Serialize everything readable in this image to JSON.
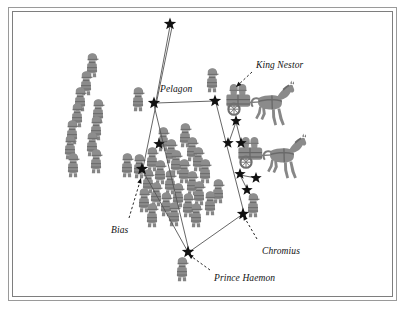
{
  "diagram": {
    "background_color": "#ffffff",
    "frame": {
      "outer_color": "#9a9a9a",
      "inner_color": "#7e7e7e"
    },
    "colors": {
      "figure_fill": "#8d8d8d",
      "figure_dark": "#6f6f6f",
      "star": "#111111",
      "line": "#555555",
      "text": "#111111"
    },
    "labels": [
      {
        "id": "king-nestor",
        "text": "King Nestor",
        "x": 256,
        "y": 60,
        "anchor_x": 236,
        "anchor_y": 87,
        "arrow_from_x": 252,
        "arrow_from_y": 72
      },
      {
        "id": "pelagon",
        "text": "Pelagon",
        "x": 160,
        "y": 84,
        "anchor_x": 0,
        "anchor_y": 0,
        "arrow_from_x": 0,
        "arrow_from_y": 0
      },
      {
        "id": "bias",
        "text": "Bias",
        "x": 111,
        "y": 225,
        "anchor_x": 141,
        "anchor_y": 178,
        "arrow_from_x": 129,
        "arrow_from_y": 218
      },
      {
        "id": "chromius",
        "text": "Chromius",
        "x": 262,
        "y": 246,
        "anchor_x": 243,
        "anchor_y": 215,
        "arrow_from_x": 257,
        "arrow_from_y": 239
      },
      {
        "id": "prince-haemon",
        "text": "Prince Haemon",
        "x": 214,
        "y": 273,
        "anchor_x": 188,
        "anchor_y": 254,
        "arrow_from_x": 210,
        "arrow_from_y": 270
      }
    ],
    "stars": [
      {
        "id": "star-top",
        "x": 170,
        "y": 24,
        "size": 13
      },
      {
        "id": "star-pelagon",
        "x": 154,
        "y": 103,
        "size": 13
      },
      {
        "id": "star-king-nestor",
        "x": 215,
        "y": 101,
        "size": 13
      },
      {
        "id": "star-left-mid",
        "x": 159,
        "y": 144,
        "size": 12
      },
      {
        "id": "star-bias",
        "x": 142,
        "y": 169,
        "size": 13
      },
      {
        "id": "star-nestor-right-a",
        "x": 236,
        "y": 121,
        "size": 12
      },
      {
        "id": "star-nestor-right-b",
        "x": 228,
        "y": 143,
        "size": 12
      },
      {
        "id": "star-nestor-right-c",
        "x": 241,
        "y": 143,
        "size": 12
      },
      {
        "id": "star-chariot2-a",
        "x": 240,
        "y": 174,
        "size": 12
      },
      {
        "id": "star-chariot2-b",
        "x": 256,
        "y": 178,
        "size": 12
      },
      {
        "id": "star-chariot2-c",
        "x": 247,
        "y": 190,
        "size": 12
      },
      {
        "id": "star-chromius",
        "x": 243,
        "y": 214,
        "size": 13
      },
      {
        "id": "star-haemon",
        "x": 188,
        "y": 252,
        "size": 13
      }
    ],
    "formation_lines": [
      {
        "id": "line-top-to-pelagon",
        "x1": 170,
        "y1": 26,
        "x2": 156,
        "y2": 101
      },
      {
        "id": "line-pelagon-to-nestor",
        "x1": 156,
        "y1": 103,
        "x2": 214,
        "y2": 101
      },
      {
        "id": "line-top-to-bias",
        "x1": 172,
        "y1": 27,
        "x2": 143,
        "y2": 168
      },
      {
        "id": "line-pelagon-down",
        "x1": 154,
        "y1": 105,
        "x2": 189,
        "y2": 251
      },
      {
        "id": "line-nestor-down",
        "x1": 216,
        "y1": 103,
        "x2": 244,
        "y2": 213
      },
      {
        "id": "line-bias-to-haemon",
        "x1": 143,
        "y1": 171,
        "x2": 188,
        "y2": 252
      },
      {
        "id": "line-haemon-to-chromius",
        "x1": 189,
        "y1": 252,
        "x2": 243,
        "y2": 214
      },
      {
        "id": "line-nestor-cluster-a",
        "x1": 236,
        "y1": 122,
        "x2": 229,
        "y2": 142
      },
      {
        "id": "line-nestor-cluster-b",
        "x1": 236,
        "y1": 122,
        "x2": 241,
        "y2": 142
      },
      {
        "id": "line-chariot2-a",
        "x1": 240,
        "y1": 175,
        "x2": 256,
        "y2": 178
      },
      {
        "id": "line-chariot2-b",
        "x1": 240,
        "y1": 175,
        "x2": 247,
        "y2": 189
      }
    ],
    "soldier_groups": [
      {
        "id": "left-column-group",
        "name": "left-flank-infantry",
        "positions": [
          {
            "x": 92,
            "y": 66
          },
          {
            "x": 86,
            "y": 84
          },
          {
            "x": 80,
            "y": 100
          },
          {
            "x": 98,
            "y": 112
          },
          {
            "x": 77,
            "y": 116
          },
          {
            "x": 96,
            "y": 129
          },
          {
            "x": 72,
            "y": 133
          },
          {
            "x": 92,
            "y": 145
          },
          {
            "x": 70,
            "y": 148
          },
          {
            "x": 96,
            "y": 162
          },
          {
            "x": 73,
            "y": 166
          }
        ]
      },
      {
        "id": "center-block-group",
        "name": "center-phalanx",
        "positions": [
          {
            "x": 163,
            "y": 140
          },
          {
            "x": 185,
            "y": 136
          },
          {
            "x": 171,
            "y": 152
          },
          {
            "x": 192,
            "y": 150
          },
          {
            "x": 152,
            "y": 160
          },
          {
            "x": 176,
            "y": 163
          },
          {
            "x": 198,
            "y": 160
          },
          {
            "x": 139,
            "y": 167
          },
          {
            "x": 160,
            "y": 173
          },
          {
            "x": 184,
            "y": 172
          },
          {
            "x": 205,
            "y": 172
          },
          {
            "x": 148,
            "y": 182
          },
          {
            "x": 170,
            "y": 183
          },
          {
            "x": 192,
            "y": 184
          },
          {
            "x": 156,
            "y": 195
          },
          {
            "x": 178,
            "y": 196
          },
          {
            "x": 199,
            "y": 194
          },
          {
            "x": 218,
            "y": 192
          },
          {
            "x": 144,
            "y": 201
          },
          {
            "x": 166,
            "y": 205
          },
          {
            "x": 188,
            "y": 206
          },
          {
            "x": 210,
            "y": 204
          },
          {
            "x": 152,
            "y": 216
          },
          {
            "x": 174,
            "y": 215
          },
          {
            "x": 196,
            "y": 216
          }
        ]
      },
      {
        "id": "commander-figures",
        "name": "named-commander-figures",
        "positions": [
          {
            "x": 138,
            "y": 100
          },
          {
            "x": 212,
            "y": 81
          },
          {
            "x": 127,
            "y": 166
          },
          {
            "x": 253,
            "y": 206
          },
          {
            "x": 182,
            "y": 270
          }
        ]
      }
    ],
    "chariots": [
      {
        "id": "chariot-upper",
        "x": 246,
        "y": 105,
        "scale": 1.0,
        "name": "chariot-with-horse-upper"
      },
      {
        "id": "chariot-lower",
        "x": 258,
        "y": 158,
        "scale": 1.0,
        "name": "chariot-with-horse-lower"
      }
    ]
  }
}
